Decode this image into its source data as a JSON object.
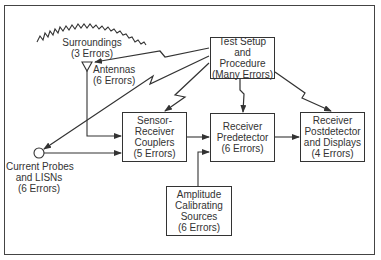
{
  "diagram": {
    "type": "block-diagram",
    "colors": {
      "stroke": "#333333",
      "background": "#ffffff",
      "text": "#333333"
    },
    "nodes": {
      "test_setup": {
        "lines": [
          "Test Setup",
          "and",
          "Procedure",
          "(Many Errors)"
        ]
      },
      "sensor_couplers": {
        "lines": [
          "Sensor-",
          "Receiver",
          "Couplers",
          "(5 Errors)"
        ]
      },
      "receiver_predetector": {
        "lines": [
          "Receiver",
          "Predetector",
          "(6 Errors)"
        ]
      },
      "receiver_postdetector": {
        "lines": [
          "Receiver",
          "Postdetector",
          "and Displays",
          "(4 Errors)"
        ]
      },
      "amplitude_sources": {
        "lines": [
          "Amplitude",
          "Calibrating",
          "Sources",
          "(6 Errors)"
        ]
      },
      "surroundings": {
        "lines": [
          "Surroundings",
          "(3 Errors)"
        ]
      },
      "antennas": {
        "lines": [
          "Antennas",
          "(6 Errors)"
        ]
      },
      "current_probes": {
        "lines": [
          "Current Probes",
          "and LISNs",
          "(6 Errors)"
        ]
      }
    },
    "edges": [
      {
        "from": "antennas",
        "to": "sensor_couplers",
        "style": "solid-arrow"
      },
      {
        "from": "current_probes",
        "to": "sensor_couplers",
        "style": "solid-arrow"
      },
      {
        "from": "sensor_couplers",
        "to": "receiver_predetector",
        "style": "solid-arrow"
      },
      {
        "from": "receiver_predetector",
        "to": "receiver_postdetector",
        "style": "solid-arrow"
      },
      {
        "from": "amplitude_sources",
        "to": "receiver_predetector",
        "style": "solid-arrow"
      },
      {
        "from": "test_setup",
        "to": "antennas",
        "style": "lightning-arrow"
      },
      {
        "from": "test_setup",
        "to": "current_probes",
        "style": "lightning-arrow"
      },
      {
        "from": "test_setup",
        "to": "sensor_couplers",
        "style": "lightning-arrow"
      },
      {
        "from": "test_setup",
        "to": "receiver_predetector",
        "style": "lightning-arrow"
      },
      {
        "from": "test_setup",
        "to": "receiver_postdetector",
        "style": "lightning-arrow"
      }
    ]
  }
}
